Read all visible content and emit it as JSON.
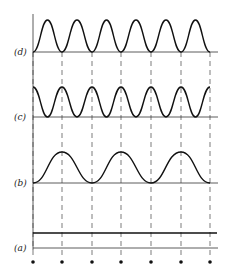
{
  "figure": {
    "panels": [
      {
        "id": "d",
        "label": "(d)",
        "description": "cosine-shaped waveform, 6 periods, minima at sample points"
      },
      {
        "id": "c",
        "label": "(c)",
        "description": "cosine waveform, 6 periods, maxima at sample points"
      },
      {
        "id": "b",
        "label": "(b)",
        "description": "raised cosine, 3 periods, minima at every other sample point"
      },
      {
        "id": "a",
        "label": "(a)",
        "description": "constant (DC) level"
      }
    ],
    "sample_points": 7,
    "colors": {
      "line": "#222222",
      "background": "#ffffff"
    }
  }
}
